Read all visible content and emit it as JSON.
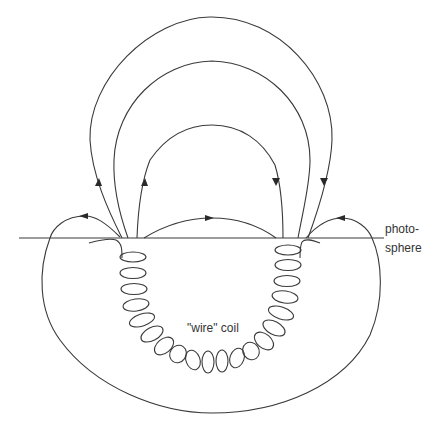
{
  "diagram": {
    "labels": {
      "photosphere_line1": "photo-",
      "photosphere_line2": "sphere",
      "coil": "\"wire\" coil"
    },
    "colors": {
      "stroke": "#3a3a3a",
      "background": "#ffffff",
      "text": "#333333"
    },
    "elements": {
      "photosphere_line": "horizontal line at y≈238",
      "field_lines_above": 6,
      "subsurface_loop": "large U-shaped loop below surface",
      "coil_turns": 20,
      "arrows": [
        "left outer arc: upward",
        "left middle arc: upward",
        "right middle arc: downward",
        "right outer arc: downward",
        "low central arc: rightward",
        "left low arc: leftward",
        "right low arc: leftward"
      ]
    }
  }
}
